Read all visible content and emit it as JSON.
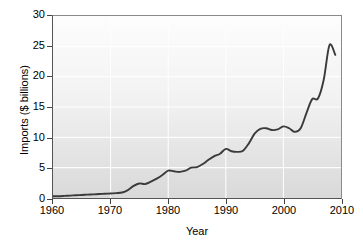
{
  "chart_data": {
    "type": "line",
    "title": "",
    "xlabel": "Year",
    "ylabel": "Imports ($ billions)",
    "xlim": [
      1960,
      2010
    ],
    "ylim": [
      0,
      30
    ],
    "xticks": [
      1960,
      1970,
      1980,
      1990,
      2000,
      2010
    ],
    "yticks": [
      0,
      5,
      10,
      15,
      20,
      25,
      30
    ],
    "grid": true,
    "legend": "none",
    "line_color": "#3a3a3a",
    "series": [
      {
        "name": "Imports",
        "x": [
          1960,
          1961,
          1962,
          1963,
          1964,
          1965,
          1966,
          1967,
          1968,
          1969,
          1970,
          1971,
          1972,
          1973,
          1974,
          1975,
          1976,
          1977,
          1978,
          1979,
          1980,
          1981,
          1982,
          1983,
          1984,
          1985,
          1986,
          1987,
          1988,
          1989,
          1990,
          1991,
          1992,
          1993,
          1994,
          1995,
          1996,
          1997,
          1998,
          1999,
          2000,
          2001,
          2002,
          2003,
          2004,
          2005,
          2006,
          2007,
          2008,
          2009
        ],
        "values": [
          0.3,
          0.3,
          0.35,
          0.4,
          0.45,
          0.5,
          0.55,
          0.6,
          0.65,
          0.7,
          0.75,
          0.8,
          0.9,
          1.3,
          2.0,
          2.4,
          2.3,
          2.7,
          3.2,
          3.8,
          4.5,
          4.4,
          4.3,
          4.5,
          5.0,
          5.1,
          5.6,
          6.3,
          6.9,
          7.3,
          8.1,
          7.7,
          7.6,
          7.8,
          9.0,
          10.6,
          11.4,
          11.5,
          11.2,
          11.3,
          11.8,
          11.5,
          10.9,
          11.5,
          14.0,
          16.3,
          16.4,
          19.5,
          25.2,
          23.6
        ]
      }
    ]
  },
  "axes": {
    "y_title": "Imports ($ billions)",
    "x_title": "Year",
    "y_tick_labels": [
      "30",
      "25",
      "20",
      "15",
      "10",
      "5",
      "0"
    ],
    "x_tick_labels": [
      "1960",
      "1970",
      "1980",
      "1990",
      "2000",
      "2010"
    ]
  }
}
